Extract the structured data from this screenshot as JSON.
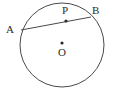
{
  "figure": {
    "kind": "circle-chord-geometry-diagram",
    "background_color": "#ffffff",
    "stroke_color": "#4a4a4a",
    "label_color": "#2b2b2b",
    "stroke_width": 1,
    "circle": {
      "name": "main-circle",
      "center_x": 62,
      "center_y": 45,
      "radius": 42
    },
    "chord": {
      "name": "chord-AB",
      "x1": 21,
      "y1": 30,
      "x2": 91,
      "y2": 17
    },
    "points": [
      {
        "id": "A",
        "label": "A",
        "dot": false,
        "x": 21,
        "y": 30,
        "label_x": 6,
        "label_y": 24
      },
      {
        "id": "P",
        "label": "P",
        "dot": true,
        "x": 66,
        "y": 21,
        "label_x": 62,
        "label_y": 5
      },
      {
        "id": "B",
        "label": "B",
        "dot": false,
        "x": 91,
        "y": 17,
        "label_x": 92,
        "label_y": 5
      },
      {
        "id": "O",
        "label": "O",
        "dot": true,
        "x": 62,
        "y": 43,
        "label_x": 58,
        "label_y": 47
      }
    ],
    "dot_radius": 1.6
  }
}
